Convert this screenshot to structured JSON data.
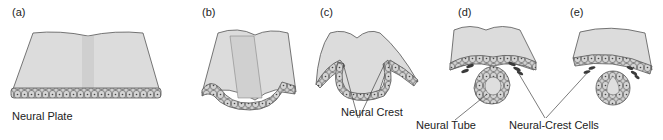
{
  "figure": {
    "panels": [
      {
        "id": "a",
        "label": "(a)"
      },
      {
        "id": "b",
        "label": "(b)"
      },
      {
        "id": "c",
        "label": "(c)"
      },
      {
        "id": "d",
        "label": "(d)"
      },
      {
        "id": "e",
        "label": "(e)"
      }
    ],
    "annotations": {
      "neural_plate": "Neural Plate",
      "neural_crest": "Neural Crest",
      "neural_tube": "Neural Tube",
      "neural_crest_cells": "Neural-Crest Cells"
    },
    "colors": {
      "ectoderm_fill": "#d9d9d9",
      "cell_fill": "#c8c8c8",
      "outline": "#555555",
      "crest_cell": "#3a3a3a",
      "leader_line": "#444444"
    }
  }
}
